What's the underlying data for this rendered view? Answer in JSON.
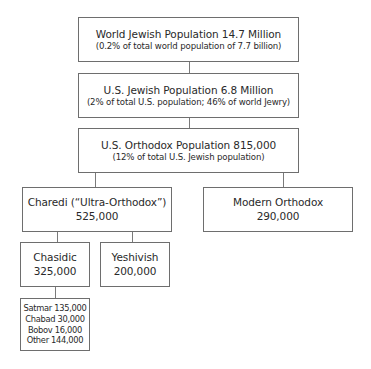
{
  "diagram": {
    "type": "hierarchy",
    "nodes": {
      "world": {
        "title": "World Jewish Population 14.7 Million",
        "subtitle": "(0.2% of total world population of 7.7 billion)"
      },
      "us": {
        "title": "U.S. Jewish Population 6.8 Million",
        "subtitle": "(2% of total U.S. population; 46% of world Jewry)"
      },
      "orthodox": {
        "title": "U.S. Orthodox Population 815,000",
        "subtitle": "(12% of total U.S. Jewish population)"
      },
      "charedi": {
        "title": "Charedi (“Ultra-Orthodox”)",
        "value": "525,000"
      },
      "modern": {
        "title": "Modern Orthodox",
        "value": "290,000"
      },
      "chasidic": {
        "title": "Chasidic",
        "value": "325,000"
      },
      "yeshivish": {
        "title": "Yeshivish",
        "value": "200,000"
      },
      "chasidic_groups": {
        "items": [
          "Satmar 135,000",
          "Chabad 30,000",
          "Bobov 16,000",
          "Other 144,000"
        ]
      }
    },
    "edges": [
      [
        "world",
        "us"
      ],
      [
        "us",
        "orthodox"
      ],
      [
        "orthodox",
        "charedi"
      ],
      [
        "orthodox",
        "modern"
      ],
      [
        "charedi",
        "chasidic"
      ],
      [
        "charedi",
        "yeshivish"
      ],
      [
        "chasidic",
        "chasidic_groups"
      ]
    ],
    "colors": {
      "border": "#6e6e6e",
      "connector": "#7a7a7a",
      "text": "#2a2a2a",
      "background": "#ffffff"
    }
  }
}
